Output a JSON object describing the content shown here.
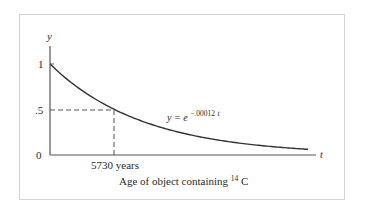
{
  "chart_data": {
    "type": "line",
    "title": "",
    "xlabel": "Age of object containing 14C",
    "xlabel_parts": {
      "prefix": "Age of object containing ",
      "superscript": "14",
      "suffix": "C"
    },
    "ylabel": "y",
    "x_axis_label": "t",
    "yticks": [
      "0",
      ".5",
      "1"
    ],
    "ytick_values": [
      0,
      0.5,
      1
    ],
    "xticks": [
      "5730 years"
    ],
    "xtick_values": [
      5730
    ],
    "ylim": [
      0,
      1.2
    ],
    "xlim": [
      0,
      23500
    ],
    "grid": false,
    "series": [
      {
        "name": "y = e^(-.00012 t)",
        "formula": "y = e^(-0.00012 t)",
        "decay_constant": 0.00012,
        "x": [
          0,
          2000,
          4000,
          5730,
          8000,
          10000,
          12000,
          14000,
          16000,
          18000,
          20000,
          23100
        ],
        "values": [
          1.0,
          0.787,
          0.619,
          0.503,
          0.383,
          0.301,
          0.237,
          0.186,
          0.147,
          0.115,
          0.091,
          0.063
        ]
      }
    ],
    "annotations": [
      {
        "text": "y = e^(-.00012t)",
        "base": "y = e",
        "exponent": "−.00012",
        "exponent_var": "t",
        "position": "right of curve near t≈9000"
      },
      {
        "type": "dashed-guide",
        "x": 5730,
        "y": 0.5,
        "description": "half-life marker: dashed lines from y=.5 and t=5730 years meeting on the curve",
        "note": "5730 years is the rounded half-life label; the exact decay constant would be ln2/5730 ≈ 0.000121, so the printed formula gives y≈0.503 at t=5730"
      }
    ],
    "legend": "none"
  }
}
